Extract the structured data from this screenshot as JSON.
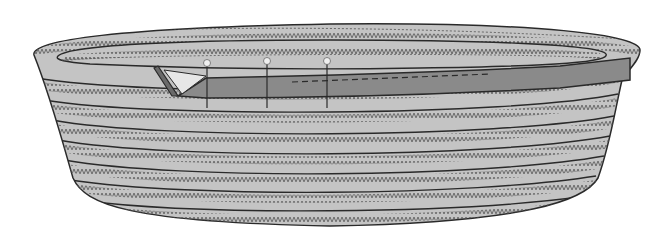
{
  "illustration": {
    "subject": "coiled rope basket with strap being pinned to rim",
    "colors": {
      "background": "#ffffff",
      "basket_fill": "#c4c4c4",
      "outline": "#2a2a2a",
      "zigzag": "#5a5a5a",
      "strap_fill": "#8a8a8a",
      "strap_fold": "#e6e6e6",
      "pin_head": "#efefef"
    },
    "coil_rows": 8,
    "pins": [
      {
        "x": 207,
        "y": 64
      },
      {
        "x": 267,
        "y": 62
      },
      {
        "x": 327,
        "y": 62
      }
    ]
  }
}
